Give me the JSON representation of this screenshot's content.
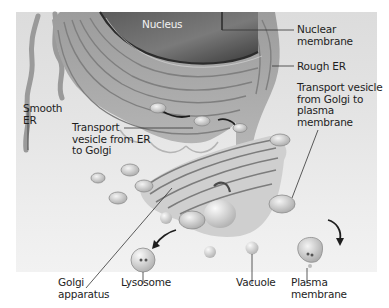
{
  "diagram": {
    "type": "cell organelle illustration (endomembrane system, grayscale)",
    "labels": {
      "nucleus": "Nucleus",
      "nuclear_membrane": "Nuclear\nmembrane",
      "rough_er": "Rough ER",
      "smooth_er": "Smooth\nER",
      "transport_vesicle_er_golgi": "Transport\nvesicle from ER\nto Golgi",
      "transport_vesicle_golgi_pm": "Transport vesicle\nfrom Golgi to\nplasma\nmembrane",
      "golgi_apparatus": "Golgi\napparatus",
      "lysosome": "Lysosome",
      "vacuole": "Vacuole",
      "plasma_membrane": "Plasma\nmembrane"
    },
    "colors": {
      "background": "#e4e4e4",
      "organelle_light": "#c8c8c8",
      "organelle_mid": "#9a9a9a",
      "organelle_dark": "#4a4a4a",
      "label_text": "#1e1e1e",
      "leader_line": "#333333"
    }
  }
}
